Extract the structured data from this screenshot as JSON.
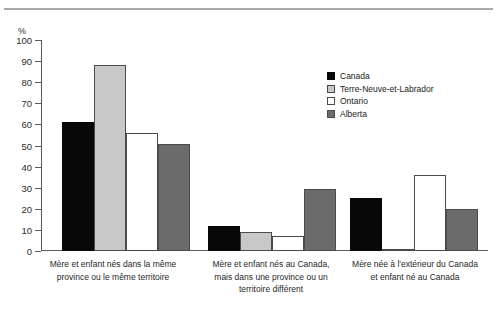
{
  "figure": {
    "top_artifact_text": "",
    "unit_label": "%"
  },
  "legend": {
    "position": "top-right-inside",
    "entries": [
      {
        "label": "Canada",
        "color": "#080808",
        "swatch": "canada-swatch"
      },
      {
        "label": "Terre-Neuve-et-Labrador",
        "color": "#c8c8c8",
        "swatch": "tnl-swatch"
      },
      {
        "label": "Ontario",
        "color": "#ffffff",
        "swatch": "ontario-swatch"
      },
      {
        "label": "Alberta",
        "color": "#6b6b6b",
        "swatch": "alberta-swatch"
      }
    ]
  },
  "chart_data": {
    "type": "bar",
    "title": "",
    "subtitle": "",
    "xlabel": "",
    "ylabel": "%",
    "ylim": [
      0,
      100
    ],
    "yticks": [
      0,
      10,
      20,
      30,
      40,
      50,
      60,
      70,
      80,
      90,
      100
    ],
    "ytick_labels": [
      "0",
      "10",
      "20",
      "30",
      "40",
      "50",
      "60",
      "70",
      "80",
      "90",
      "100"
    ],
    "grid": false,
    "legend_position": "upper right",
    "categories": [
      "Mère et enfant nés dans la même province ou le même territoire",
      "Mère et enfant nés au Canada, mais dans une province ou un territoire différent",
      "Mère née à l'extérieur du Canada et enfant né au Canada"
    ],
    "category_lines": [
      [
        "Mère et enfant nés dans la même",
        "province ou le même territoire"
      ],
      [
        "Mère et enfant nés au Canada,",
        "mais dans une province ou un",
        "territoire différent"
      ],
      [
        "Mère née à l'extérieur du Canada",
        "et enfant né au Canada"
      ]
    ],
    "series": [
      {
        "name": "Canada",
        "color": "#080808",
        "values": [
          61,
          12,
          25
        ]
      },
      {
        "name": "Terre-Neuve-et-Labrador",
        "color": "#c8c8c8",
        "values": [
          88,
          9,
          0.5
        ]
      },
      {
        "name": "Ontario",
        "color": "#ffffff",
        "values": [
          56,
          7,
          36
        ]
      },
      {
        "name": "Alberta",
        "color": "#6b6b6b",
        "values": [
          50.5,
          29.5,
          20
        ]
      }
    ]
  },
  "colors": {
    "axis": "#5a5a5a",
    "rule": "#a8a8a8",
    "text": "#1a1a1a",
    "background": "#ffffff"
  }
}
